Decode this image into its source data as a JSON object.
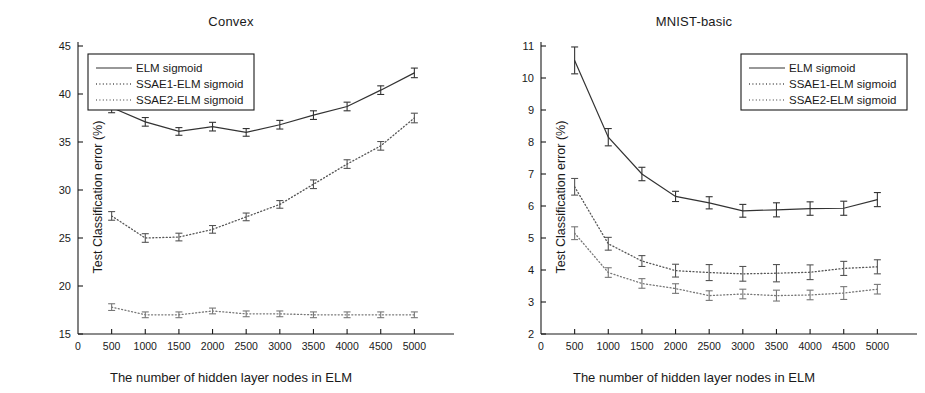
{
  "figure": {
    "background": "#ffffff",
    "ink": "#1a1a1a",
    "panel_count": 2
  },
  "chart_data": [
    {
      "type": "line",
      "title": "Convex",
      "xlabel": "The number of hidden layer nodes in ELM",
      "ylabel": "Test Classification error (%)",
      "x": [
        500,
        1000,
        1500,
        2000,
        2500,
        3000,
        3500,
        4000,
        4500,
        5000
      ],
      "xlim": [
        0,
        5500
      ],
      "ylim": [
        15,
        45
      ],
      "xticks": [
        0,
        500,
        1000,
        1500,
        2000,
        2500,
        3000,
        3500,
        4000,
        4500,
        5000
      ],
      "xticklabels": [
        "0",
        "500",
        "1000",
        "1500",
        "2000",
        "2500",
        "3000",
        "3500",
        "4000",
        "4500",
        "5000"
      ],
      "yticks": [
        15,
        20,
        25,
        30,
        35,
        40,
        45
      ],
      "yticklabels": [
        "15",
        "20",
        "25",
        "30",
        "35",
        "40",
        "45"
      ],
      "grid": false,
      "legend_position": "upper-left",
      "error_bars": true,
      "series": [
        {
          "name": "ELM sigmoid",
          "style": "solid",
          "color": "#333333",
          "values": [
            38.6,
            37.1,
            36.1,
            36.6,
            36.0,
            36.8,
            37.8,
            38.7,
            40.4,
            42.2
          ],
          "errors": [
            0.55,
            0.45,
            0.4,
            0.45,
            0.4,
            0.45,
            0.45,
            0.45,
            0.45,
            0.5
          ]
        },
        {
          "name": "SSAE1-ELM sigmoid",
          "style": "dotted",
          "color": "#555555",
          "values": [
            27.3,
            25.0,
            25.1,
            25.9,
            27.2,
            28.5,
            30.6,
            32.7,
            34.6,
            37.5
          ],
          "errors": [
            0.45,
            0.45,
            0.4,
            0.4,
            0.4,
            0.4,
            0.45,
            0.45,
            0.45,
            0.5
          ]
        },
        {
          "name": "SSAE2-ELM sigmoid",
          "style": "dotted",
          "color": "#777777",
          "values": [
            17.8,
            17.0,
            17.0,
            17.4,
            17.1,
            17.1,
            17.0,
            17.0,
            17.0,
            17.0
          ],
          "errors": [
            0.35,
            0.3,
            0.3,
            0.3,
            0.3,
            0.3,
            0.3,
            0.3,
            0.3,
            0.3
          ]
        }
      ]
    },
    {
      "type": "line",
      "title": "MNIST-basic",
      "xlabel": "The number of hidden layer nodes in ELM",
      "ylabel": "Test Classification error (%)",
      "x": [
        500,
        1000,
        1500,
        2000,
        2500,
        3000,
        3500,
        4000,
        4500,
        5000
      ],
      "xlim": [
        0,
        5500
      ],
      "ylim": [
        2,
        11
      ],
      "xticks": [
        0,
        500,
        1000,
        1500,
        2000,
        2500,
        3000,
        3500,
        4000,
        4500,
        5000
      ],
      "xticklabels": [
        "0",
        "500",
        "1000",
        "1500",
        "2000",
        "2500",
        "3000",
        "3500",
        "4000",
        "4500",
        "5000"
      ],
      "yticks": [
        2,
        3,
        4,
        5,
        6,
        7,
        8,
        9,
        10,
        11
      ],
      "yticklabels": [
        "2",
        "3",
        "4",
        "5",
        "6",
        "7",
        "8",
        "9",
        "10",
        "11"
      ],
      "grid": false,
      "legend_position": "upper-right",
      "error_bars": true,
      "series": [
        {
          "name": "ELM sigmoid",
          "style": "solid",
          "color": "#333333",
          "values": [
            10.55,
            8.15,
            7.0,
            6.3,
            6.1,
            5.85,
            5.88,
            5.92,
            5.93,
            6.2
          ],
          "errors": [
            0.42,
            0.27,
            0.21,
            0.16,
            0.19,
            0.2,
            0.22,
            0.21,
            0.22,
            0.22
          ]
        },
        {
          "name": "SSAE1-ELM sigmoid",
          "style": "dotted",
          "color": "#555555",
          "values": [
            6.6,
            4.82,
            4.28,
            3.98,
            3.92,
            3.88,
            3.9,
            3.93,
            4.05,
            4.1
          ],
          "errors": [
            0.26,
            0.2,
            0.17,
            0.2,
            0.25,
            0.23,
            0.27,
            0.23,
            0.22,
            0.22
          ]
        },
        {
          "name": "SSAE2-ELM sigmoid",
          "style": "dotted",
          "color": "#777777",
          "values": [
            5.15,
            3.92,
            3.58,
            3.42,
            3.2,
            3.25,
            3.2,
            3.22,
            3.28,
            3.4
          ],
          "errors": [
            0.2,
            0.15,
            0.15,
            0.15,
            0.15,
            0.15,
            0.17,
            0.15,
            0.2,
            0.15
          ]
        }
      ]
    }
  ]
}
